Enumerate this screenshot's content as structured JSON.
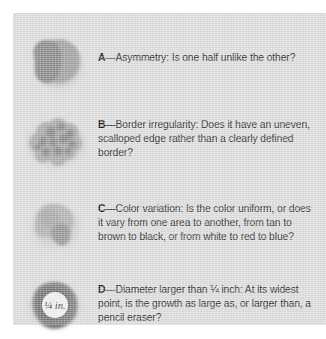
{
  "figure": {
    "background_color": "#dcdcdc",
    "text_color": "#2b2b2b"
  },
  "items": [
    {
      "letter": "A",
      "dash": "—",
      "term": "Asymmetry:",
      "body": " Is one half unlike the other?",
      "illustration_name": "asymmetric-mole-illustration",
      "illustration_colors": [
        "#8d8d8d",
        "#a5a5a5"
      ],
      "label": ""
    },
    {
      "letter": "B",
      "dash": "—",
      "term": "Border irregularity:",
      "body": " Does it have an uneven, scalloped edge rather than a clearly defined border?",
      "illustration_name": "irregular-border-mole-illustration",
      "illustration_colors": [
        "#a8a8a8",
        "#8a8a8a"
      ],
      "label": ""
    },
    {
      "letter": "C",
      "dash": "—",
      "term": "Color variation:",
      "body": " Is the color uniform, or does it vary from one area to another, from tan to brown to black, or from white to red to blue?",
      "illustration_name": "color-variation-mole-illustration",
      "illustration_colors": [
        "#aeaeae",
        "#949494"
      ],
      "label": ""
    },
    {
      "letter": "D",
      "dash": "—",
      "term": "Diameter larger than ¼ inch:",
      "body": " At its widest point, is the growth as large as, or larger than, a pencil eraser?",
      "illustration_name": "diameter-mole-illustration",
      "illustration_colors": [
        "#7d7d7d",
        "#6f6f6f"
      ],
      "label": "¼ in."
    }
  ]
}
